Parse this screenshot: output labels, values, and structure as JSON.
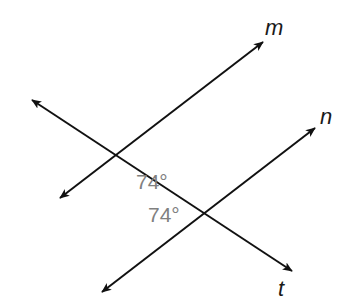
{
  "diagram": {
    "type": "parallel lines cut by a transversal",
    "lines": {
      "m": {
        "label": "m"
      },
      "n": {
        "label": "n"
      },
      "t": {
        "label": "t"
      }
    },
    "angles": [
      {
        "label": "74°",
        "at": "intersection of t and m"
      },
      {
        "label": "74°",
        "at": "intersection of t and n"
      }
    ],
    "colors": {
      "line": "#111111",
      "angle_text": "#808080"
    }
  }
}
